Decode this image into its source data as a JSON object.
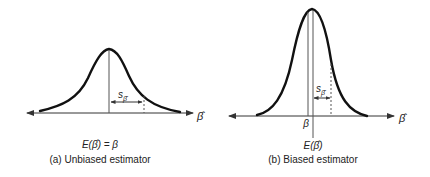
{
  "panels": [
    {
      "id": "a",
      "caption": "(a) Unbiased estimator",
      "expectation_label": "E(β̂) = β",
      "se_label": "s",
      "se_sub": "β̂",
      "axis_label": "β̂",
      "curve": {
        "start_x": 40,
        "peak_x": 109,
        "peak_y": 49,
        "end_x": 180,
        "base_y": 113
      },
      "dashed_x": 144
    },
    {
      "id": "b",
      "caption": "(b) Biased estimator",
      "expectation_label": "E(β̂)",
      "true_param_label": "β",
      "se_label": "s",
      "se_sub": "β̂",
      "axis_label": "β̂",
      "curve": {
        "start_x": 257,
        "peak_x": 312,
        "peak_y": 9,
        "end_x": 367,
        "base_y": 116
      },
      "dashed_x": 331
    }
  ],
  "colors": {
    "curve": "#111111",
    "axis": "#333333",
    "line": "#555555"
  }
}
